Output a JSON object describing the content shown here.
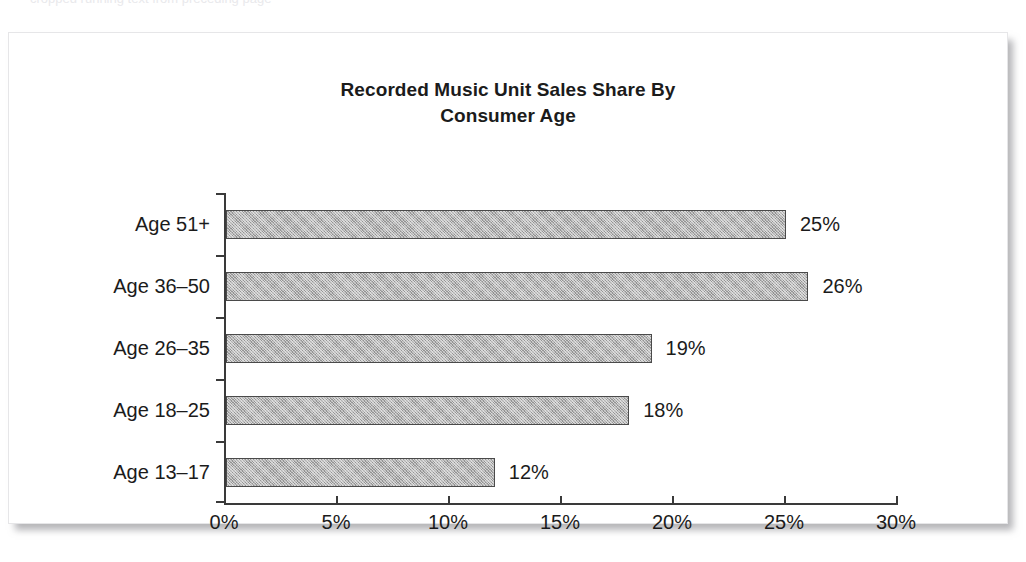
{
  "page": {
    "ghost_line_text": "cropped running text from preceding page"
  },
  "figure": {
    "title_line1": "Recorded Music Unit Sales Share By",
    "title_line2": "Consumer Age"
  },
  "chart_data": {
    "type": "bar",
    "orientation": "horizontal",
    "title": "Recorded Music Unit Sales Share By Consumer Age",
    "xlabel": "",
    "ylabel": "",
    "categories": [
      "Age 13–17",
      "Age 18–25",
      "Age 26–35",
      "Age 36–50",
      "Age 51+"
    ],
    "values": [
      12,
      18,
      19,
      26,
      25
    ],
    "value_labels": [
      "12%",
      "18%",
      "19%",
      "26%",
      "25%"
    ],
    "xlim": [
      0,
      30
    ],
    "xticks": [
      0,
      5,
      10,
      15,
      20,
      25,
      30
    ],
    "xtick_labels": [
      "0%",
      "5%",
      "10%",
      "15%",
      "20%",
      "25%",
      "30%"
    ],
    "grid": false,
    "legend": false,
    "bar_fill_color": "#b3b3b3",
    "bar_border_color": "#4a4a4a",
    "axis_color": "#3a3a3a",
    "text_color": "#1b1b1b",
    "background_color": "#ffffff"
  }
}
